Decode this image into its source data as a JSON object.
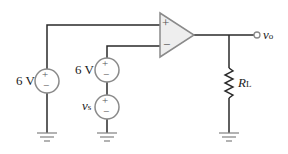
{
  "diagram": {
    "type": "op-amp circuit",
    "colors": {
      "wire": "#2a2a2a",
      "component_outline": "#8a8a8a",
      "opamp_fill": "#eeeeee"
    },
    "source_left": {
      "label": "6 V",
      "polarity_top": "+",
      "polarity_bottom": "−"
    },
    "source_mid": {
      "label": "6 V",
      "polarity_top": "+",
      "polarity_bottom": "−"
    },
    "source_vs": {
      "label_main": "v",
      "label_sub": "s",
      "polarity_top": "+",
      "polarity_bottom": "−"
    },
    "opamp": {
      "noninverting": "+",
      "inverting": "−"
    },
    "output": {
      "label_main": "v",
      "label_sub": "o"
    },
    "load": {
      "label_main": "R",
      "label_sub": "L"
    }
  }
}
